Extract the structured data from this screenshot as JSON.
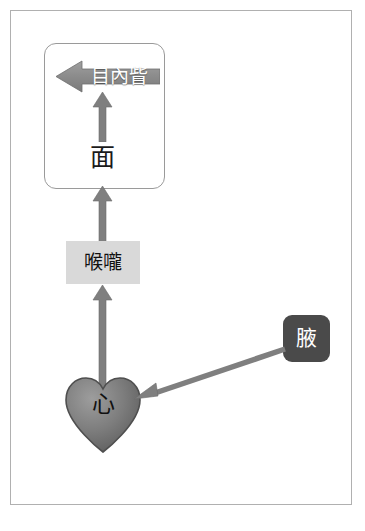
{
  "diagram": {
    "colors": {
      "frame_border": "#b0b0b0",
      "group_box_border": "#9a9a9a",
      "arrow_gray": "#808080",
      "throat_box_fill": "#d9d9d9",
      "axilla_box_fill": "#4a4a4a",
      "heart_fill": "#787878",
      "canthus_arrow_fill": "#8a8a8a",
      "text_dark": "#111111",
      "text_light": "#ffffff",
      "page_background": "#ffffff"
    },
    "nodes": {
      "canthus": {
        "label": "目內眥",
        "shape": "left-block-arrow",
        "text_color": "#ffffff"
      },
      "face": {
        "label": "面",
        "shape": "plain-text",
        "text_color": "#111111"
      },
      "throat": {
        "label": "喉嚨",
        "shape": "rectangle",
        "text_color": "#111111"
      },
      "heart": {
        "label": "心",
        "shape": "heart",
        "text_color": "#111111"
      },
      "axilla": {
        "label": "腋",
        "shape": "rounded-rectangle",
        "text_color": "#ffffff"
      }
    },
    "group_box": {
      "name": "face-region-group",
      "contains": [
        "目內眥",
        "面"
      ]
    },
    "edges": [
      {
        "from": "腋",
        "to": "心",
        "direction": "diagonal-down-left",
        "style": "solid-arrow"
      },
      {
        "from": "心",
        "to": "喉嚨",
        "direction": "up",
        "style": "solid-arrow"
      },
      {
        "from": "喉嚨",
        "to": "面",
        "direction": "up",
        "style": "solid-arrow"
      },
      {
        "from": "面",
        "to": "目內眥",
        "direction": "up",
        "style": "solid-arrow"
      }
    ]
  }
}
